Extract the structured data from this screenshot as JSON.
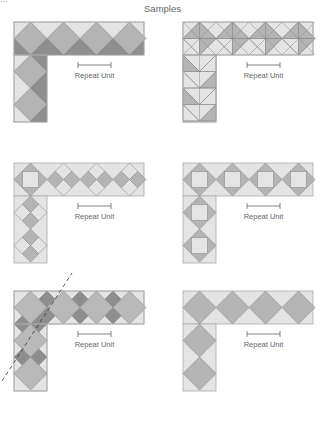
{
  "header": {
    "fragment": "...",
    "title": "Samples"
  },
  "colors": {
    "light": "#e4e4e4",
    "mid": "#b4b4b4",
    "dark": "#8e8e8e",
    "line": "#8a8a8a",
    "outline": "#aaaaaa"
  },
  "panels": [
    {
      "id": "panel-1",
      "x": 14,
      "y": 22,
      "pattern": "large-diamond-dark-shadow",
      "repeat_label": "Repeat Unit"
    },
    {
      "id": "panel-2",
      "x": 183,
      "y": 22,
      "pattern": "half-square-triangles",
      "repeat_label": "Repeat Unit"
    },
    {
      "id": "panel-3",
      "x": 14,
      "y": 163,
      "pattern": "small-diamonds-checker",
      "repeat_label": "Repeat Unit"
    },
    {
      "id": "panel-4",
      "x": 183,
      "y": 163,
      "pattern": "square-in-diamond",
      "repeat_label": "Repeat Unit"
    },
    {
      "id": "panel-5",
      "x": 14,
      "y": 291,
      "pattern": "large-diamond-small-dark-diamonds",
      "repeat_label": "Repeat Unit",
      "mitre_line": true
    },
    {
      "id": "panel-6",
      "x": 183,
      "y": 291,
      "pattern": "large-diamond-plain",
      "repeat_label": "Repeat Unit"
    }
  ]
}
